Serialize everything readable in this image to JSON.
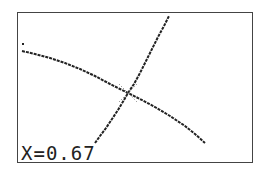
{
  "calculator": {
    "screen_type": "graph",
    "readout": {
      "label": "X=0.67",
      "variable": "X",
      "value": "0.67"
    },
    "colors": {
      "pixel": "#222222",
      "background": "#ffffff",
      "frame": "#444444"
    },
    "curves": [
      {
        "name": "rising-curve",
        "points": [
          [
            95,
            143
          ],
          [
            100,
            136
          ],
          [
            106,
            128
          ],
          [
            112,
            119
          ],
          [
            118,
            110
          ],
          [
            124,
            100
          ],
          [
            128,
            93
          ],
          [
            134,
            84
          ],
          [
            140,
            73
          ],
          [
            146,
            61
          ],
          [
            152,
            49
          ],
          [
            158,
            37
          ],
          [
            164,
            26
          ],
          [
            169,
            16
          ]
        ]
      },
      {
        "name": "falling-curve",
        "points": [
          [
            22,
            51
          ],
          [
            35,
            54
          ],
          [
            50,
            58
          ],
          [
            65,
            63
          ],
          [
            80,
            69
          ],
          [
            95,
            76
          ],
          [
            110,
            84
          ],
          [
            120,
            89
          ],
          [
            128,
            93
          ],
          [
            140,
            99
          ],
          [
            155,
            107
          ],
          [
            170,
            116
          ],
          [
            185,
            126
          ],
          [
            195,
            134
          ],
          [
            205,
            143
          ]
        ]
      }
    ],
    "stray_dot": [
      22,
      43
    ],
    "trace_cursor": {
      "x": 128,
      "y": 93
    }
  }
}
